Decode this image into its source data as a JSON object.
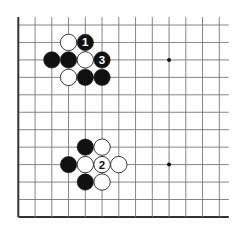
{
  "diagram": {
    "type": "go-board",
    "board_edges": {
      "left": true,
      "bottom": true,
      "top": false,
      "right": false
    },
    "visible_columns": 13,
    "visible_rows": 12,
    "colors": {
      "line": "#777777",
      "edge": "#333333",
      "black_stone": "#111111",
      "white_stone": "#ffffff",
      "stone_outline": "#222222"
    },
    "star_points": [
      {
        "col": 9,
        "row": 2
      },
      {
        "col": 9,
        "row": 8
      }
    ],
    "stones": [
      {
        "color": "white",
        "col": 3,
        "row": 1,
        "label": ""
      },
      {
        "color": "black",
        "col": 4,
        "row": 1,
        "label": "1"
      },
      {
        "color": "black",
        "col": 2,
        "row": 2,
        "label": ""
      },
      {
        "color": "black",
        "col": 3,
        "row": 2,
        "label": ""
      },
      {
        "color": "white",
        "col": 4,
        "row": 2,
        "label": ""
      },
      {
        "color": "black",
        "col": 5,
        "row": 2,
        "label": "3"
      },
      {
        "color": "white",
        "col": 3,
        "row": 3,
        "label": ""
      },
      {
        "color": "black",
        "col": 4,
        "row": 3,
        "label": ""
      },
      {
        "color": "black",
        "col": 5,
        "row": 3,
        "label": ""
      },
      {
        "color": "black",
        "col": 4,
        "row": 7,
        "label": ""
      },
      {
        "color": "white",
        "col": 5,
        "row": 7,
        "label": ""
      },
      {
        "color": "black",
        "col": 3,
        "row": 8,
        "label": ""
      },
      {
        "color": "white",
        "col": 4,
        "row": 8,
        "label": ""
      },
      {
        "color": "white",
        "col": 5,
        "row": 8,
        "label": "2"
      },
      {
        "color": "white",
        "col": 6,
        "row": 8,
        "label": ""
      },
      {
        "color": "black",
        "col": 4,
        "row": 9,
        "label": ""
      },
      {
        "color": "white",
        "col": 5,
        "row": 9,
        "label": ""
      }
    ]
  }
}
